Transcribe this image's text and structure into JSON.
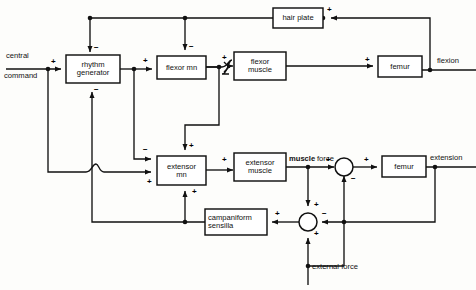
{
  "diagram": {
    "type": "control-block-diagram",
    "stroke_color": "#111111",
    "background_color": "#fdfdfb",
    "blocks": [
      {
        "id": "rhythm_generator",
        "label": "rhythm\ngenerator",
        "line1": "rhythm",
        "line2": "generator",
        "x": 66,
        "y": 58,
        "w": 54,
        "h": 28
      },
      {
        "id": "flexor_mn",
        "label": "flexor mn",
        "line1": "flexor mn",
        "line2": "",
        "x": 157,
        "y": 56,
        "w": 49,
        "h": 23
      },
      {
        "id": "flexor_muscle",
        "label": "flexor\nmuscle",
        "line1": "flexor",
        "line2": "muscle",
        "x": 234,
        "y": 52,
        "w": 52,
        "h": 28
      },
      {
        "id": "hair_plate",
        "label": "hair plate",
        "line1": "hair plate",
        "line2": "",
        "x": 273,
        "y": 8,
        "w": 50,
        "h": 20
      },
      {
        "id": "femur_flexion",
        "label": "femur",
        "line1": "femur",
        "line2": "",
        "x": 378,
        "y": 59,
        "w": 44,
        "h": 21
      },
      {
        "id": "extensor_mn",
        "label": "extensor\nmn",
        "line1": "extensor",
        "line2": "mn",
        "x": 157,
        "y": 156,
        "w": 49,
        "h": 29
      },
      {
        "id": "extensor_muscle",
        "label": "extensor\nmuscle",
        "line1": "extensor",
        "line2": "muscle",
        "x": 234,
        "y": 153,
        "w": 52,
        "h": 28
      },
      {
        "id": "campaniform_sensilla",
        "label": "campaniform\nsensilla",
        "line1": "campaniform",
        "line2": "sensilla",
        "x": 205,
        "y": 209,
        "w": 62,
        "h": 26
      },
      {
        "id": "femur_extension",
        "label": "femur",
        "line1": "femur",
        "line2": "",
        "x": 382,
        "y": 156,
        "w": 44,
        "h": 21
      }
    ],
    "junctions": [
      {
        "id": "force_sum",
        "cx": 344,
        "cy": 166,
        "r": 9,
        "signs": [
          {
            "t": "+",
            "pos": "left"
          },
          {
            "t": "−",
            "pos": "bottom-right"
          },
          {
            "t": "+",
            "pos": "right"
          }
        ]
      },
      {
        "id": "load_sum",
        "cx": 308,
        "cy": 222,
        "r": 9,
        "signs": [
          {
            "t": "+",
            "pos": "top"
          },
          {
            "t": "−",
            "pos": "right"
          },
          {
            "t": "+",
            "pos": "bottom"
          },
          {
            "t": "+",
            "pos": "left"
          }
        ]
      }
    ],
    "free_labels": [
      {
        "id": "central",
        "text": "central",
        "x": 6,
        "y": 57
      },
      {
        "id": "command",
        "text": "command",
        "x": 4,
        "y": 77
      },
      {
        "id": "flexion",
        "text": "flexion",
        "x": 437,
        "y": 59
      },
      {
        "id": "extension",
        "text": "extension",
        "x": 432,
        "y": 156
      },
      {
        "id": "muscle_force_bold",
        "text": "muscle",
        "x": 291,
        "y": 158
      },
      {
        "id": "muscle_force_rest",
        "text": "force",
        "x": 317,
        "y": 158
      },
      {
        "id": "external_force",
        "text": "external force",
        "x": 307,
        "y": 265
      }
    ],
    "signs": [
      {
        "id": "s-cc-rg",
        "text": "+",
        "x": 51,
        "y": 58
      },
      {
        "id": "s-hp-rg",
        "text": "−",
        "x": 94,
        "y": 45
      },
      {
        "id": "s-cs-rg",
        "text": "−",
        "x": 94,
        "y": 88
      },
      {
        "id": "s-rg-fmn",
        "text": "+",
        "x": 144,
        "y": 56
      },
      {
        "id": "s-hp-fmn",
        "text": "−",
        "x": 189,
        "y": 44
      },
      {
        "id": "s-fmn-fm",
        "text": "+",
        "x": 222,
        "y": 54
      },
      {
        "id": "s-fm-femur",
        "text": "+",
        "x": 367,
        "y": 58
      },
      {
        "id": "s-hairplate-in",
        "text": "+",
        "x": 327,
        "y": 7
      },
      {
        "id": "s-rg-emn",
        "text": "−",
        "x": 144,
        "y": 147
      },
      {
        "id": "s-fmn-emn",
        "text": "+",
        "x": 189,
        "y": 143
      },
      {
        "id": "s-cc-emn",
        "text": "+",
        "x": 148,
        "y": 180
      },
      {
        "id": "s-cs-emn",
        "text": "+",
        "x": 192,
        "y": 190
      },
      {
        "id": "s-emn-em",
        "text": "+",
        "x": 222,
        "y": 154
      },
      {
        "id": "s-force-sum-in",
        "text": "+",
        "x": 327,
        "y": 157
      },
      {
        "id": "s-force-sum-neg",
        "text": "−",
        "x": 351,
        "y": 177
      },
      {
        "id": "s-force-sum-out",
        "text": "+",
        "x": 366,
        "y": 157
      },
      {
        "id": "s-load-top",
        "text": "+",
        "x": 315,
        "y": 203
      },
      {
        "id": "s-load-right",
        "text": "−",
        "x": 322,
        "y": 212
      },
      {
        "id": "s-load-bottom",
        "text": "+",
        "x": 315,
        "y": 232
      },
      {
        "id": "s-load-out",
        "text": "+",
        "x": 275,
        "y": 212
      }
    ],
    "edges": [
      {
        "id": "central-command-to-rhythm-generator",
        "from": "central command",
        "to": "rhythm generator",
        "sign": "+"
      },
      {
        "id": "central-command-to-extensor-mn",
        "from": "central command",
        "to": "extensor mn",
        "sign": "+"
      },
      {
        "id": "hair-plate-to-rhythm-generator",
        "from": "hair plate",
        "to": "rhythm generator",
        "sign": "−"
      },
      {
        "id": "hair-plate-to-flexor-mn",
        "from": "hair plate",
        "to": "flexor mn",
        "sign": "−"
      },
      {
        "id": "rhythm-generator-to-flexor-mn",
        "from": "rhythm generator",
        "to": "flexor mn",
        "sign": "+"
      },
      {
        "id": "rhythm-generator-to-extensor-mn",
        "from": "rhythm generator",
        "to": "extensor mn",
        "sign": "−"
      },
      {
        "id": "flexor-mn-to-flexor-muscle",
        "from": "flexor mn",
        "to": "flexor muscle",
        "sign": "+"
      },
      {
        "id": "flexor-mn-to-extensor-mn",
        "from": "flexor mn",
        "to": "extensor mn",
        "sign": "+"
      },
      {
        "id": "flexor-muscle-to-femur",
        "from": "flexor muscle",
        "to": "femur",
        "sign": "+"
      },
      {
        "id": "femur-to-hair-plate",
        "from": "femur (flexion)",
        "to": "hair plate",
        "sign": "+"
      },
      {
        "id": "extensor-mn-to-extensor-muscle",
        "from": "extensor mn",
        "to": "extensor muscle",
        "sign": "+"
      },
      {
        "id": "extensor-muscle-to-force-sum",
        "from": "extensor muscle",
        "to": "force summing junction",
        "sign": "+"
      },
      {
        "id": "force-sum-to-femur",
        "from": "force summing junction",
        "to": "femur",
        "sign": "+"
      },
      {
        "id": "muscle-force-to-load-sum",
        "from": "muscle force",
        "to": "load summing junction",
        "sign": "+"
      },
      {
        "id": "external-force-to-load-sum",
        "from": "external force",
        "to": "load summing junction",
        "sign": "+"
      },
      {
        "id": "femur-extension-to-load-sum",
        "from": "femur (extension)",
        "to": "load summing junction",
        "sign": "−"
      },
      {
        "id": "load-sum-to-force-sum",
        "from": "load summing junction",
        "to": "force summing junction",
        "sign": "−"
      },
      {
        "id": "load-sum-to-campaniform-sensilla",
        "from": "load summing junction",
        "to": "campaniform sensilla",
        "sign": "+"
      },
      {
        "id": "campaniform-sensilla-to-extensor-mn",
        "from": "campaniform sensilla",
        "to": "extensor mn",
        "sign": "+"
      },
      {
        "id": "campaniform-sensilla-to-rhythm-generator",
        "from": "campaniform sensilla",
        "to": "rhythm generator",
        "sign": "−"
      }
    ]
  }
}
